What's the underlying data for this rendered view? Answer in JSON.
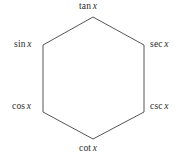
{
  "diagram": {
    "type": "trigonometric-identity-hexagon",
    "shape": "hexagon",
    "stroke_color": "#555555",
    "stroke_width": 1,
    "fill_color": "#ffffff",
    "background_color": "#ffffff",
    "vertices": [
      {
        "id": "tan",
        "position": "top",
        "function": "tan",
        "variable": "x",
        "label": "tan x",
        "x": 93,
        "y": 17
      },
      {
        "id": "sec",
        "position": "upper-right",
        "function": "sec",
        "variable": "x",
        "label": "sec x",
        "x": 144,
        "y": 45
      },
      {
        "id": "csc",
        "position": "lower-right",
        "function": "csc",
        "variable": "x",
        "label": "csc x",
        "x": 144,
        "y": 112
      },
      {
        "id": "cot",
        "position": "bottom",
        "function": "cot",
        "variable": "x",
        "label": "cot x",
        "x": 93,
        "y": 139
      },
      {
        "id": "cos",
        "position": "lower-left",
        "function": "cos",
        "variable": "x",
        "label": "cos x",
        "x": 43,
        "y": 112
      },
      {
        "id": "sin",
        "position": "upper-left",
        "function": "sin",
        "variable": "x",
        "label": "sin x",
        "x": 43,
        "y": 45
      }
    ],
    "labels": {
      "tan": {
        "fn": "tan",
        "var": "x"
      },
      "sec": {
        "fn": "sec",
        "var": "x"
      },
      "csc": {
        "fn": "csc",
        "var": "x"
      },
      "cot": {
        "fn": "cot",
        "var": "x"
      },
      "cos": {
        "fn": "cos",
        "var": "x"
      },
      "sin": {
        "fn": "sin",
        "var": "x"
      }
    }
  }
}
